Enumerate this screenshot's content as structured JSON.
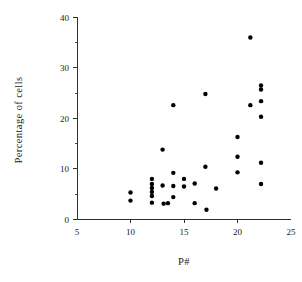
{
  "chart_data": {
    "type": "scatter",
    "title": "",
    "xlabel": "P#",
    "ylabel": "Percentage of cells",
    "xlim": [
      5,
      25
    ],
    "ylim": [
      0,
      40
    ],
    "xticks": [
      5,
      10,
      15,
      20,
      25
    ],
    "xtick_labels": [
      "5",
      "10",
      "15",
      "20",
      "25"
    ],
    "yticks": [
      0,
      10,
      20,
      30,
      40
    ],
    "ytick_labels": [
      "0",
      "10",
      "20",
      "30",
      "40"
    ],
    "x_minor_ticks": [],
    "y_minor_ticks": [
      5,
      15,
      25,
      35
    ],
    "grid": false,
    "legend": null,
    "marker": "filled-circle",
    "marker_color": "#000000",
    "marker_size_px": 4.4,
    "points": [
      {
        "x": 10.0,
        "y": 5.3
      },
      {
        "x": 10.0,
        "y": 3.7
      },
      {
        "x": 12.0,
        "y": 8.0
      },
      {
        "x": 12.0,
        "y": 7.0
      },
      {
        "x": 12.0,
        "y": 6.2
      },
      {
        "x": 12.0,
        "y": 5.4
      },
      {
        "x": 12.0,
        "y": 4.6
      },
      {
        "x": 12.0,
        "y": 3.3
      },
      {
        "x": 13.0,
        "y": 13.8
      },
      {
        "x": 13.0,
        "y": 6.7
      },
      {
        "x": 13.1,
        "y": 3.1
      },
      {
        "x": 13.5,
        "y": 3.2
      },
      {
        "x": 14.0,
        "y": 22.6
      },
      {
        "x": 14.0,
        "y": 9.2
      },
      {
        "x": 14.0,
        "y": 6.6
      },
      {
        "x": 14.0,
        "y": 4.4
      },
      {
        "x": 15.0,
        "y": 8.0
      },
      {
        "x": 15.0,
        "y": 6.5
      },
      {
        "x": 16.0,
        "y": 7.1
      },
      {
        "x": 16.0,
        "y": 3.2
      },
      {
        "x": 17.0,
        "y": 24.8
      },
      {
        "x": 17.0,
        "y": 10.4
      },
      {
        "x": 17.1,
        "y": 1.9
      },
      {
        "x": 18.0,
        "y": 6.1
      },
      {
        "x": 20.0,
        "y": 16.3
      },
      {
        "x": 20.0,
        "y": 12.4
      },
      {
        "x": 20.0,
        "y": 9.3
      },
      {
        "x": 21.2,
        "y": 36.0
      },
      {
        "x": 21.2,
        "y": 22.6
      },
      {
        "x": 22.2,
        "y": 26.5
      },
      {
        "x": 22.2,
        "y": 25.7
      },
      {
        "x": 22.2,
        "y": 23.4
      },
      {
        "x": 22.2,
        "y": 20.3
      },
      {
        "x": 22.2,
        "y": 11.2
      },
      {
        "x": 22.2,
        "y": 7.0
      }
    ]
  },
  "axes": {
    "x_axis_title": "P#",
    "y_axis_title": "Percentage of cells"
  }
}
